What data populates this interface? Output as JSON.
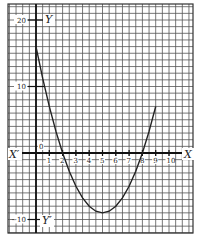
{
  "chart_data": {
    "type": "line",
    "title": "",
    "function": "y = x^2 - 10x + 16",
    "x": [
      0,
      0.5,
      1,
      1.5,
      2,
      2.5,
      3,
      3.5,
      4,
      4.5,
      5,
      5.5,
      6,
      6.5,
      7,
      7.5,
      8,
      8.5,
      9
    ],
    "y": [
      16,
      11.25,
      7,
      3.25,
      0,
      -2.75,
      -5,
      -6.75,
      -8,
      -8.75,
      -9,
      -8.75,
      -8,
      -6.75,
      -5,
      -2.75,
      0,
      3.25,
      7
    ],
    "xlim": [
      -2,
      11.5
    ],
    "ylim": [
      -11,
      22
    ],
    "grid": true,
    "axis_labels": {
      "x_pos": "X",
      "x_neg": "X′",
      "y_pos": "Y",
      "y_neg": "Y′",
      "origin": "0"
    },
    "x_ticks": [
      "1",
      "2",
      "3",
      "4",
      "5",
      "6",
      "7",
      "8",
      "9",
      "10"
    ],
    "y_ticks": [
      {
        "value": 20,
        "label": "20"
      },
      {
        "value": 10,
        "label": "10"
      },
      {
        "value": -10,
        "label": "−10"
      }
    ]
  }
}
